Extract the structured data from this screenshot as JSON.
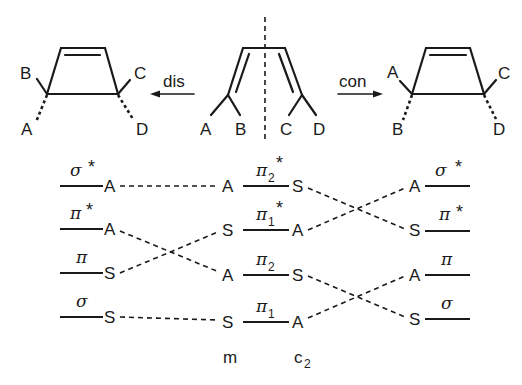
{
  "top": {
    "reactant": {
      "name": "butadiene",
      "substituents": [
        "A",
        "B",
        "C",
        "D"
      ],
      "symmetry_axis": "mirror plane (dashed)"
    },
    "left_product": {
      "mode_label": "dis",
      "substituents": {
        "upper_left": "B",
        "lower_left": "A",
        "upper_right": "C",
        "lower_right": "D"
      }
    },
    "right_product": {
      "mode_label": "con",
      "substituents": {
        "upper_left": "A",
        "lower_left": "B",
        "upper_right": "C",
        "lower_right": "D"
      }
    }
  },
  "correlation": {
    "left_levels": [
      {
        "label": "σ",
        "star": "*",
        "symmetry": "A"
      },
      {
        "label": "π",
        "star": "*",
        "symmetry": "A"
      },
      {
        "label": "π",
        "star": "",
        "symmetry": "S"
      },
      {
        "label": "σ",
        "star": "",
        "symmetry": "S"
      }
    ],
    "center_levels": [
      {
        "label": "π",
        "sub": "2",
        "star": "*",
        "m": "A",
        "c2": "S"
      },
      {
        "label": "π",
        "sub": "1",
        "star": "*",
        "m": "S",
        "c2": "A"
      },
      {
        "label": "π",
        "sub": "2",
        "star": "",
        "m": "A",
        "c2": "S"
      },
      {
        "label": "π",
        "sub": "1",
        "star": "",
        "m": "S",
        "c2": "A"
      }
    ],
    "right_levels": [
      {
        "label": "σ",
        "star": "*",
        "symmetry": "A"
      },
      {
        "label": "π",
        "star": "*",
        "symmetry": "S"
      },
      {
        "label": "π",
        "star": "",
        "symmetry": "A"
      },
      {
        "label": "σ",
        "star": "",
        "symmetry": "S"
      }
    ],
    "column_labels": {
      "m": "m",
      "c2_main": "c",
      "c2_sub": "2"
    }
  }
}
